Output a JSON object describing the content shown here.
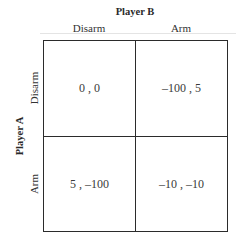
{
  "game": {
    "player_b": {
      "label": "Player B",
      "strategies": [
        "Disarm",
        "Arm"
      ]
    },
    "player_a": {
      "label": "Player A",
      "strategies": [
        "Disarm",
        "Arm"
      ]
    },
    "payoffs": [
      [
        "0 , 0",
        "–100 , 5"
      ],
      [
        "5 , –100",
        "–10 , –10"
      ]
    ],
    "payoff_values": [
      [
        [
          0,
          0
        ],
        [
          -100,
          5
        ]
      ],
      [
        [
          5,
          -100
        ],
        [
          -10,
          -10
        ]
      ]
    ]
  }
}
